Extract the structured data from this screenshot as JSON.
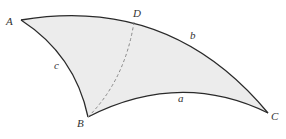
{
  "diagram": {
    "type": "spherical-triangle",
    "fill_color": "#ececec",
    "stroke_color": "#2a2a2a",
    "dash_color": "#888888",
    "vertices": {
      "A": "A",
      "B": "B",
      "C": "C",
      "D": "D"
    },
    "sides": {
      "a": "a",
      "b": "b",
      "c": "c"
    }
  }
}
